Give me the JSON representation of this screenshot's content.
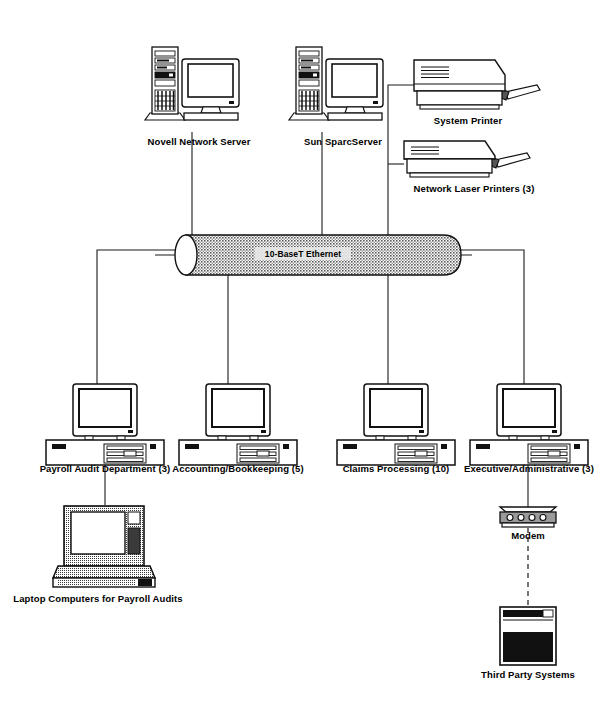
{
  "diagram": {
    "bus": {
      "label": "10-BaseT Ethernet",
      "name": "ethernet-backbone",
      "fill": "#b4b4b4",
      "stroke": "#000000"
    },
    "nodes": [
      {
        "id": "novell-network-server",
        "label": "Novell Network Server",
        "type": "tower-server",
        "x": 148,
        "y": 46,
        "label_x": 199,
        "label_y": 145
      },
      {
        "id": "sun-sparcserver",
        "label": "Sun SparcServer",
        "type": "tower-server",
        "x": 292,
        "y": 46,
        "label_x": 343,
        "label_y": 145
      },
      {
        "id": "system-printer",
        "label": "System Printer",
        "type": "printer",
        "x": 414,
        "y": 58,
        "label_x": 468,
        "label_y": 124
      },
      {
        "id": "network-laser-printers",
        "label": "Network Laser Printers (3)",
        "type": "printer",
        "x": 404,
        "y": 139,
        "label_x": 474,
        "label_y": 192
      },
      {
        "id": "payroll-audit-department",
        "label": "Payroll Audit Department (3)",
        "type": "desktop",
        "x": 45,
        "y": 377,
        "label_x": 105,
        "label_y": 472
      },
      {
        "id": "accounting-bookkeeping",
        "label": "Accounting/Bookkeeping (5)",
        "type": "desktop",
        "x": 177,
        "y": 377,
        "label_x": 238,
        "label_y": 472
      },
      {
        "id": "claims-processing",
        "label": "Claims Processing (10)",
        "type": "desktop",
        "x": 340,
        "y": 377,
        "label_x": 396,
        "label_y": 472
      },
      {
        "id": "executive-administrative",
        "label": "Executive/Administrative (3)",
        "type": "desktop",
        "x": 469,
        "y": 377,
        "label_x": 529,
        "label_y": 472
      },
      {
        "id": "laptop-computers-payroll-audits",
        "label": "Laptop Computers for Payroll Audits",
        "type": "laptop",
        "x": 57,
        "y": 503,
        "label_x": 98,
        "label_y": 578
      },
      {
        "id": "modem",
        "label": "Modem",
        "type": "modem",
        "x": 505,
        "y": 505,
        "label_x": 528,
        "label_y": 536
      },
      {
        "id": "third-party-systems",
        "label": "Third Party Systems",
        "type": "external-system",
        "x": 500,
        "y": 605,
        "label_x": 528,
        "label_y": 678
      }
    ]
  }
}
